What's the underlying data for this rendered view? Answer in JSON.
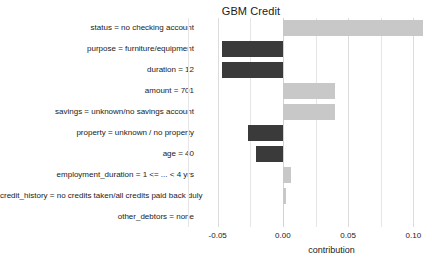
{
  "chart_data": {
    "type": "bar",
    "orientation": "horizontal",
    "title": "GBM Credit",
    "xlabel": "contribution",
    "ylabel": "",
    "xlim": [
      -0.0643,
      0.1143
    ],
    "grid": true,
    "legend": false,
    "xticks": [
      -0.05,
      0.0,
      0.05,
      0.1
    ],
    "xticklabels": [
      "-0.05",
      "0.00",
      "0.05",
      "0.10"
    ],
    "minor_gridlines": [
      -0.0725,
      -0.025,
      0.025,
      0.075,
      0.125
    ],
    "colors": {
      "positive": "#c8c8c8",
      "negative": "#3a3a3a",
      "grid": "#e6e6e6",
      "zero_line": "#d2d2d2",
      "background": "#ffffff",
      "text": "#1a1a1a"
    },
    "categories": [
      "status = no checking account",
      "purpose = furniture/equipment",
      "duration = 12",
      "amount = 701",
      "savings = unknown/no savings account",
      "property = unknown / no property",
      "age = 40",
      "employment_duration = 1 <= ... < 4 yrs",
      "credit_history = no credits taken/all credits paid back duly",
      "other_debtors = none"
    ],
    "values": [
      0.1075,
      -0.047,
      -0.047,
      0.0401,
      0.0398,
      -0.0269,
      -0.0206,
      0.0063,
      0.0027,
      0.0
    ]
  }
}
